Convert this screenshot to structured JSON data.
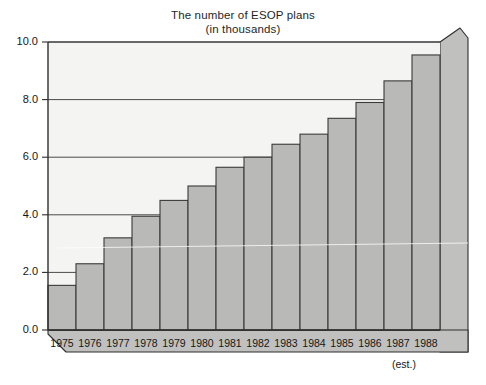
{
  "chart_data": {
    "type": "bar",
    "title": "The number of ESOP plans",
    "subtitle": "(in thousands)",
    "xlabel": "",
    "ylabel": "",
    "categories": [
      "1975",
      "1976",
      "1977",
      "1978",
      "1979",
      "1980",
      "1981",
      "1982",
      "1983",
      "1984",
      "1985",
      "1986",
      "1987",
      "1988"
    ],
    "values": [
      1.55,
      2.3,
      3.2,
      3.95,
      4.5,
      5.0,
      5.65,
      6.0,
      6.45,
      6.8,
      7.35,
      7.9,
      8.65,
      9.55
    ],
    "ylim": [
      0.0,
      10.0
    ],
    "ytick_labels": [
      "0.0",
      "2.0",
      "4.0",
      "6.0",
      "8.0",
      "10.0"
    ],
    "ytick_values": [
      0.0,
      2.0,
      4.0,
      6.0,
      8.0,
      10.0
    ],
    "grid": true,
    "legend": "none",
    "annotations": [
      {
        "text": "(est.)",
        "attached_to": "1988"
      }
    ],
    "style": {
      "bar_fill": "#b9b9b7",
      "bar_stroke": "#3a3a3a",
      "plot_background": "#f4f4f2",
      "side_panel_fill": "#c0c0be",
      "axis_color": "#2e2e2e",
      "grid_color": "#4a4a4a",
      "page_background": "#ffffff"
    }
  }
}
